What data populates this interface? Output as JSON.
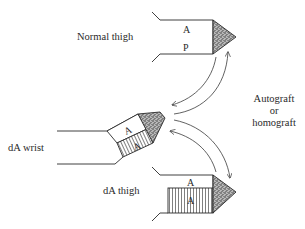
{
  "labels": {
    "normal_thigh": "Normal thigh",
    "da_wrist": "dA wrist",
    "da_thigh": "dA thigh",
    "graft_line1": "Autograft",
    "graft_line2": "or",
    "graft_line3": "homograft"
  },
  "limbs": {
    "normal_thigh": {
      "zone_top": "A",
      "zone_bottom": "P"
    },
    "da_wrist": {
      "zone_top": "A",
      "zone_bottom": "A"
    },
    "da_thigh": {
      "zone_top": "A",
      "zone_bottom": "A"
    }
  },
  "colors": {
    "ink": "#2a2a2a",
    "background": "#ffffff"
  }
}
